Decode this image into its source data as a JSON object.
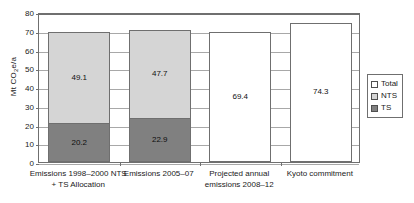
{
  "chart_data": {
    "type": "bar",
    "subtype": "stacked-bar",
    "title": "",
    "xlabel": "",
    "ylabel": "Mt CO2e/a",
    "ylabel_parts": {
      "prefix": "Mt CO",
      "sub": "2",
      "suffix": "e/a"
    },
    "ylim": [
      0,
      80
    ],
    "yticks": [
      0,
      10,
      20,
      30,
      40,
      50,
      60,
      70,
      80
    ],
    "ytick_labels": [
      "0",
      "10",
      "20",
      "30",
      "40",
      "50",
      "60",
      "70",
      "80"
    ],
    "grid": true,
    "legend_position": "right",
    "categories": [
      "Emissions 1998–2000 NTS\n+ TS Allocation",
      "Emissions 2005–07",
      "Projected annual\nemissions 2008–12",
      "Kyoto commitment"
    ],
    "series": [
      {
        "name": "TS",
        "values": [
          20.2,
          22.9,
          null,
          null
        ],
        "color": "#808080"
      },
      {
        "name": "NTS",
        "values": [
          49.1,
          47.7,
          null,
          null
        ],
        "color": "#d5d5d5"
      },
      {
        "name": "Total",
        "values": [
          null,
          null,
          69.4,
          74.3
        ],
        "color": "#ffffff"
      }
    ],
    "bars": [
      {
        "category_label": "Emissions 1998–2000 NTS\n+ TS Allocation",
        "total": 69.3,
        "segments": [
          {
            "series": "NTS",
            "value": 49.1,
            "label": "49.1",
            "kind": "nts"
          },
          {
            "series": "TS",
            "value": 20.2,
            "label": "20.2",
            "kind": "ts"
          }
        ]
      },
      {
        "category_label": "Emissions 2005–07",
        "total": 70.6,
        "segments": [
          {
            "series": "NTS",
            "value": 47.7,
            "label": "47.7",
            "kind": "nts"
          },
          {
            "series": "TS",
            "value": 22.9,
            "label": "22.9",
            "kind": "ts"
          }
        ]
      },
      {
        "category_label": "Projected annual\nemissions 2008–12",
        "total": 69.4,
        "segments": [
          {
            "series": "Total",
            "value": 69.4,
            "label": "69.4",
            "kind": "total"
          }
        ]
      },
      {
        "category_label": "Kyoto commitment",
        "total": 74.3,
        "segments": [
          {
            "series": "Total",
            "value": 74.3,
            "label": "74.3",
            "kind": "total"
          }
        ]
      }
    ],
    "legend": [
      {
        "label": "Total",
        "kind": "total",
        "color": "#ffffff"
      },
      {
        "label": "NTS",
        "kind": "nts",
        "color": "#d5d5d5"
      },
      {
        "label": "TS",
        "kind": "ts",
        "color": "#808080"
      }
    ],
    "colors": {
      "ts": "#808080",
      "nts": "#d5d5d5",
      "total": "#ffffff",
      "axis": "#6f6f6f",
      "grid": "#a8a8a8",
      "text": "#1a1a1a",
      "background": "#ffffff"
    }
  }
}
